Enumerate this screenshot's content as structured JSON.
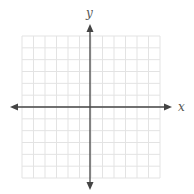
{
  "diagram": {
    "type": "coordinate-plane",
    "axes": {
      "x_label": "x",
      "y_label": "y",
      "color": "#444444"
    },
    "grid": {
      "columns": 12,
      "rows": 12,
      "color": "#e3e3e3",
      "left": 22,
      "top": 36,
      "right": 160,
      "bottom": 178
    },
    "origin": {
      "x": 90,
      "y": 107
    },
    "x_axis_extent": {
      "start": 10,
      "end": 172
    },
    "y_axis_extent": {
      "start": 24,
      "end": 190
    }
  }
}
